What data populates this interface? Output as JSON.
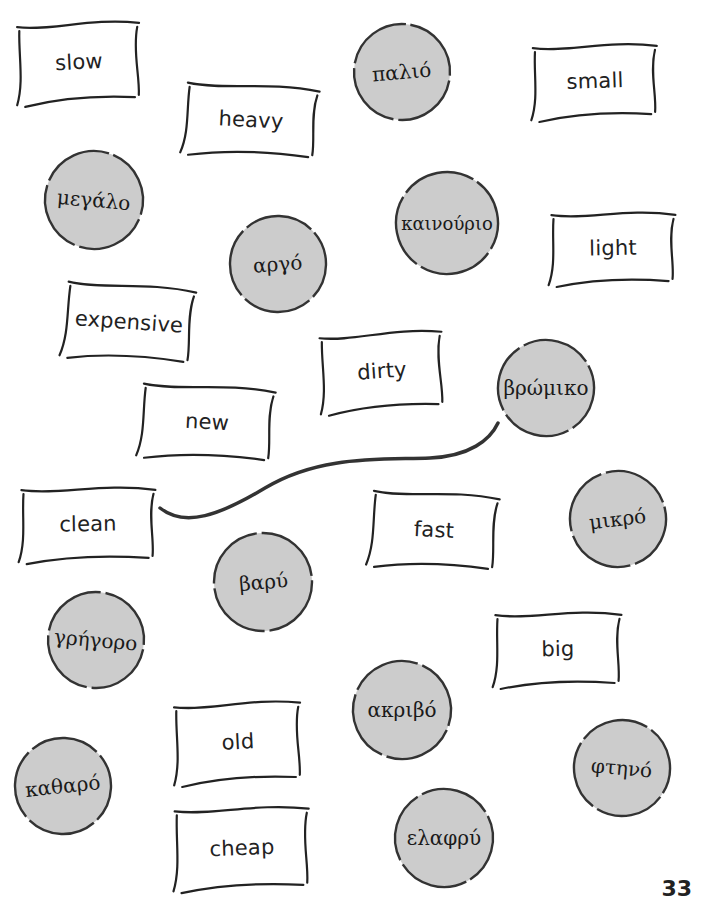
{
  "colors": {
    "bubble_fill": "#cccccc",
    "ink": "#222222",
    "background": "#ffffff"
  },
  "english_cards": [
    {
      "id": "slow",
      "label": "slow",
      "x": 15,
      "y": 20,
      "w": 128,
      "h": 84,
      "rot": -3
    },
    {
      "id": "heavy",
      "label": "heavy",
      "x": 182,
      "y": 82,
      "w": 138,
      "h": 76,
      "rot": 3
    },
    {
      "id": "small",
      "label": "small",
      "x": 530,
      "y": 42,
      "w": 130,
      "h": 78,
      "rot": -2
    },
    {
      "id": "light",
      "label": "light",
      "x": 548,
      "y": 210,
      "w": 130,
      "h": 76,
      "rot": -1
    },
    {
      "id": "expensive",
      "label": "expensive",
      "x": 62,
      "y": 282,
      "w": 134,
      "h": 80,
      "rot": 4
    },
    {
      "id": "dirty",
      "label": "dirty",
      "x": 318,
      "y": 330,
      "w": 128,
      "h": 82,
      "rot": -4
    },
    {
      "id": "new",
      "label": "new",
      "x": 138,
      "y": 383,
      "w": 138,
      "h": 78,
      "rot": 3
    },
    {
      "id": "clean",
      "label": "clean",
      "x": 18,
      "y": 485,
      "w": 140,
      "h": 78,
      "rot": -1
    },
    {
      "id": "fast",
      "label": "fast",
      "x": 368,
      "y": 490,
      "w": 132,
      "h": 80,
      "rot": 3
    },
    {
      "id": "big",
      "label": "big",
      "x": 492,
      "y": 610,
      "w": 132,
      "h": 78,
      "rot": -1
    },
    {
      "id": "old",
      "label": "old",
      "x": 172,
      "y": 700,
      "w": 132,
      "h": 84,
      "rot": -3
    },
    {
      "id": "cheap",
      "label": "cheap",
      "x": 172,
      "y": 805,
      "w": 140,
      "h": 86,
      "rot": -2
    }
  ],
  "greek_bubbles": [
    {
      "id": "palio",
      "label": "παλιό",
      "cx": 402,
      "cy": 72,
      "r": 49,
      "rot": -5
    },
    {
      "id": "megalo",
      "label": "μεγάλο",
      "cx": 94,
      "cy": 200,
      "r": 50,
      "rot": 5
    },
    {
      "id": "kainourio",
      "label": "καινούριο",
      "cx": 447,
      "cy": 223,
      "r": 52,
      "rot": 0
    },
    {
      "id": "argo",
      "label": "αργό",
      "cx": 278,
      "cy": 264,
      "r": 49,
      "rot": -4
    },
    {
      "id": "vromiko",
      "label": "βρώμικο",
      "cx": 546,
      "cy": 388,
      "r": 49,
      "rot": 0
    },
    {
      "id": "mikro",
      "label": "μικρό",
      "cx": 618,
      "cy": 519,
      "r": 49,
      "rot": -7
    },
    {
      "id": "vary",
      "label": "βαρύ",
      "cx": 263,
      "cy": 582,
      "r": 50,
      "rot": -5
    },
    {
      "id": "grigoro",
      "label": "γρήγορο",
      "cx": 96,
      "cy": 640,
      "r": 49,
      "rot": 5
    },
    {
      "id": "akrivo",
      "label": "ακριβό",
      "cx": 402,
      "cy": 710,
      "r": 50,
      "rot": 0
    },
    {
      "id": "ftino",
      "label": "φτηνό",
      "cx": 622,
      "cy": 768,
      "r": 49,
      "rot": 5
    },
    {
      "id": "katharo",
      "label": "καθαρό",
      "cx": 63,
      "cy": 786,
      "r": 49,
      "rot": -6
    },
    {
      "id": "elafry",
      "label": "ελαφρύ",
      "cx": 444,
      "cy": 838,
      "r": 50,
      "rot": 0
    }
  ],
  "connections": [
    {
      "from": "clean",
      "to": "vromiko",
      "path": "M160,508 C185,528 220,515 265,488 C320,455 380,460 430,458 C470,456 490,440 498,423"
    }
  ],
  "page_number": "33"
}
